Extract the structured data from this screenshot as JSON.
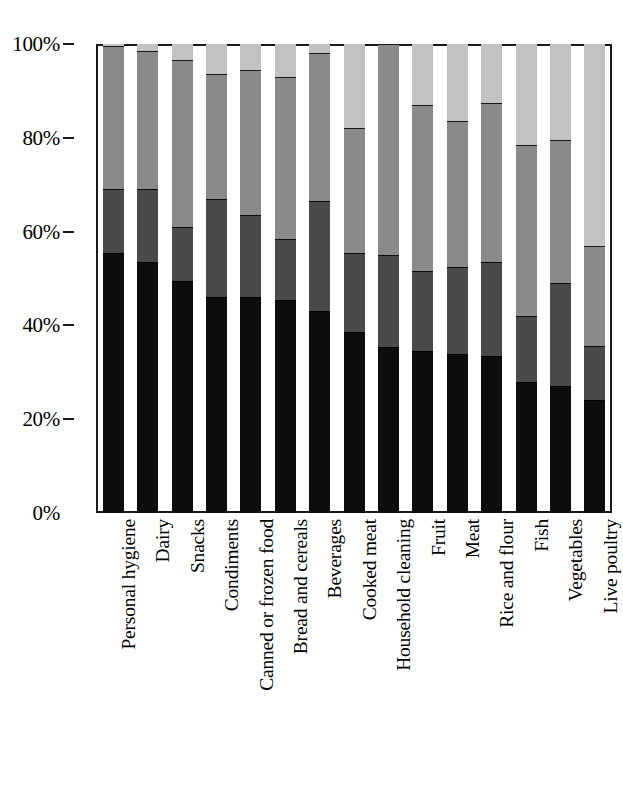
{
  "chart_data": {
    "type": "bar",
    "variant": "stacked-100-percent",
    "title": "",
    "subtitle": "",
    "xlabel": "",
    "ylabel": "",
    "ylim": [
      0,
      100
    ],
    "y_unit": "%",
    "grid": false,
    "legend_position": "none",
    "orientation": "vertical",
    "axis": {
      "y_ticks": [
        0,
        20,
        40,
        60,
        80,
        100
      ],
      "y_tick_labels": [
        "0%",
        "20%",
        "40%",
        "60%",
        "80%",
        "100%"
      ],
      "x_tick_labels_rotated": true
    },
    "categories": [
      "Personal hygiene",
      "Dairy",
      "Snacks",
      "Condiments",
      "Canned or frozen food",
      "Bread and cereals",
      "Beverages",
      "Cooked meat",
      "Household cleaning",
      "Fruit",
      "Meat",
      "Rice and flour",
      "Fish",
      "Vegetables",
      "Live poultry"
    ],
    "series": [
      {
        "name": "series-1",
        "color": "#0d0d0d",
        "stack_order": 1,
        "values": [
          55.5,
          53.5,
          49.5,
          46.0,
          46.0,
          45.5,
          43.0,
          38.5,
          35.5,
          34.5,
          34.0,
          33.5,
          28.0,
          27.0,
          24.0
        ]
      },
      {
        "name": "series-2",
        "color": "#4a4a4a",
        "stack_order": 2,
        "values": [
          13.5,
          15.5,
          11.5,
          21.0,
          17.5,
          13.0,
          23.5,
          17.0,
          19.5,
          17.0,
          18.5,
          20.0,
          14.0,
          22.0,
          11.5
        ]
      },
      {
        "name": "series-3",
        "color": "#8a8a8a",
        "stack_order": 3,
        "values": [
          30.5,
          29.5,
          35.5,
          26.5,
          31.0,
          34.5,
          31.5,
          26.5,
          45.0,
          35.5,
          31.0,
          34.0,
          36.5,
          30.5,
          21.5
        ]
      },
      {
        "name": "series-4",
        "color": "#c2c2c2",
        "stack_order": 4,
        "values": [
          0.5,
          1.5,
          3.5,
          6.5,
          5.5,
          7.0,
          2.0,
          18.0,
          0.0,
          13.0,
          16.5,
          12.5,
          21.5,
          20.5,
          43.0
        ]
      }
    ]
  },
  "figure": {
    "background_color": "#ffffff",
    "frame_color": "#1a1a1a",
    "bar_gap_ratio": 0.36
  }
}
